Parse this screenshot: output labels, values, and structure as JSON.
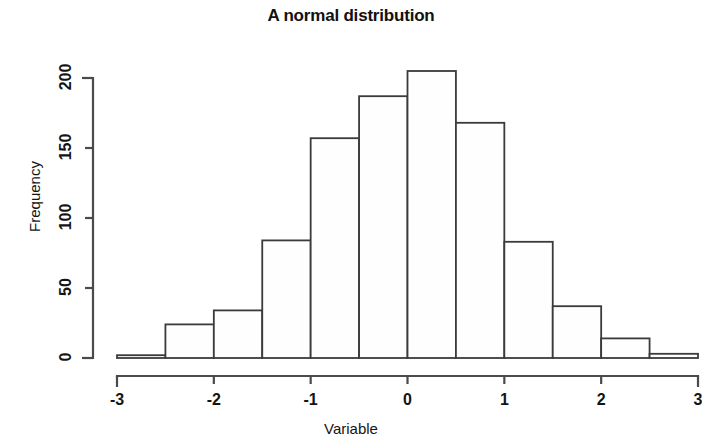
{
  "chart_data": {
    "type": "bar",
    "title": "A normal distribution",
    "xlabel": "Variable",
    "ylabel": "Frequency",
    "xlim": [
      -3,
      3
    ],
    "ylim": [
      0,
      210
    ],
    "grid": false,
    "legend": null,
    "bin_width": 0.5,
    "bin_edges": [
      -3,
      -2.5,
      -2,
      -1.5,
      -1,
      -0.5,
      0,
      0.5,
      1,
      1.5,
      2,
      2.5,
      3
    ],
    "categories": [
      "-3 to -2.5",
      "-2.5 to -2",
      "-2 to -1.5",
      "-1.5 to -1",
      "-1 to -0.5",
      "-0.5 to 0",
      "0 to 0.5",
      "0.5 to 1",
      "1 to 1.5",
      "1.5 to 2",
      "2 to 2.5",
      "2.5 to 3"
    ],
    "values": [
      2,
      24,
      34,
      84,
      157,
      187,
      205,
      168,
      83,
      37,
      14,
      3
    ],
    "xticks": [
      -3,
      -2,
      -1,
      0,
      1,
      2,
      3
    ],
    "xtick_labels": [
      "-3",
      "-2",
      "-1",
      "0",
      "1",
      "2",
      "3"
    ],
    "yticks": [
      0,
      50,
      100,
      150,
      200
    ],
    "ytick_labels": [
      "0",
      "50",
      "100",
      "150",
      "200"
    ]
  },
  "figure": {
    "title": "A normal distribution",
    "x_axis_title": "Variable",
    "y_axis_title": "Frequency",
    "bar_fill_color": "#fefefe",
    "bar_stroke_color": "#3b3b3b",
    "axis_color": "#4a4a4a",
    "background_color": "#ffffff"
  }
}
